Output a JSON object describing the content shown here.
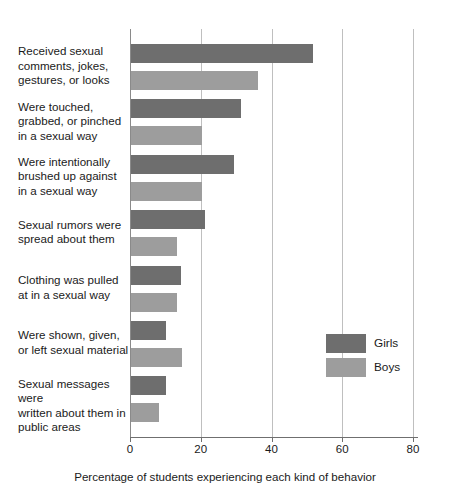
{
  "chart_data": {
    "type": "bar",
    "orientation": "horizontal",
    "title": "",
    "xlabel": "Percentage of students experiencing each kind of behavior",
    "ylabel": "",
    "xlim": [
      0,
      80
    ],
    "xticks": [
      0,
      20,
      40,
      60,
      80
    ],
    "xtick_labels": [
      "0",
      "20",
      "40",
      "60",
      "80"
    ],
    "grid": true,
    "grid_axis": "x",
    "legend_position": "inside-right",
    "categories": [
      "Received sexual comments, jokes, gestures, or looks",
      "Were touched, grabbed, or pinched in a sexual way",
      "Were intentionally brushed up against in a sexual way",
      "Sexual rumors were spread about them",
      "Clothing was pulled at in a sexual way",
      "Were shown, given, or left sexual material",
      "Sexual messages were written about them in public areas"
    ],
    "category_lines": [
      [
        "Received sexual",
        "comments, jokes,",
        "gestures, or looks"
      ],
      [
        "Were touched,",
        "grabbed, or pinched",
        "in a sexual way"
      ],
      [
        "Were intentionally",
        "brushed up against",
        "in a sexual way"
      ],
      [
        "Sexual rumors were",
        "spread about them"
      ],
      [
        "Clothing was pulled",
        "at in a sexual way"
      ],
      [
        "Were shown, given,",
        "or left sexual material"
      ],
      [
        "Sexual messages were",
        "written about them in",
        "public areas"
      ]
    ],
    "series": [
      {
        "name": "Girls",
        "color": "#6e6e6e",
        "values": [
          51.5,
          31,
          29,
          21,
          14,
          10,
          10
        ]
      },
      {
        "name": "Boys",
        "color": "#9d9d9d",
        "values": [
          36,
          20,
          20,
          13,
          13,
          14.5,
          8
        ]
      }
    ]
  },
  "legend": {
    "entries": [
      {
        "label": "Girls",
        "color": "#6e6e6e"
      },
      {
        "label": "Boys",
        "color": "#9d9d9d"
      }
    ]
  },
  "axis": {
    "x_title": "Percentage of students experiencing each kind of behavior",
    "tick_labels": [
      "0",
      "20",
      "40",
      "60",
      "80"
    ]
  }
}
